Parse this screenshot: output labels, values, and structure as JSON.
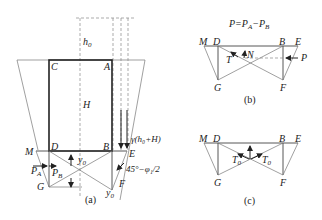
{
  "figure": {
    "panel_a": {
      "caption": "(a)",
      "labels": {
        "h0": "h",
        "h0_sub": "0",
        "C": "C",
        "A": "A",
        "H": "H",
        "D": "D",
        "B": "B",
        "M": "M",
        "E": "E",
        "G": "G",
        "F": "F",
        "PA": "P",
        "PA_sub": "A",
        "PB": "P",
        "PB_sub": "B",
        "y0": "y",
        "y0_sub": "0",
        "y0_bottom": "y",
        "y0_bottom_sub": "0",
        "load": "γ(h₀+H)",
        "angle": "45°−φ₁/2"
      }
    },
    "panel_b": {
      "caption": "(b)",
      "equation": "P=P",
      "equation_sub1": "A",
      "equation_mid": "−P",
      "equation_sub2": "B",
      "labels": {
        "M": "M",
        "D": "D",
        "B": "B",
        "E": "E",
        "G": "G",
        "F": "F",
        "T": "T",
        "N": "N",
        "P": "P"
      }
    },
    "panel_c": {
      "caption": "(c)",
      "labels": {
        "M": "M",
        "D": "D",
        "B": "B",
        "E": "E",
        "G": "G",
        "F": "F",
        "T0_left": "T",
        "T0_left_sub": "0",
        "T0_right": "T",
        "T0_right_sub": "0"
      }
    }
  }
}
